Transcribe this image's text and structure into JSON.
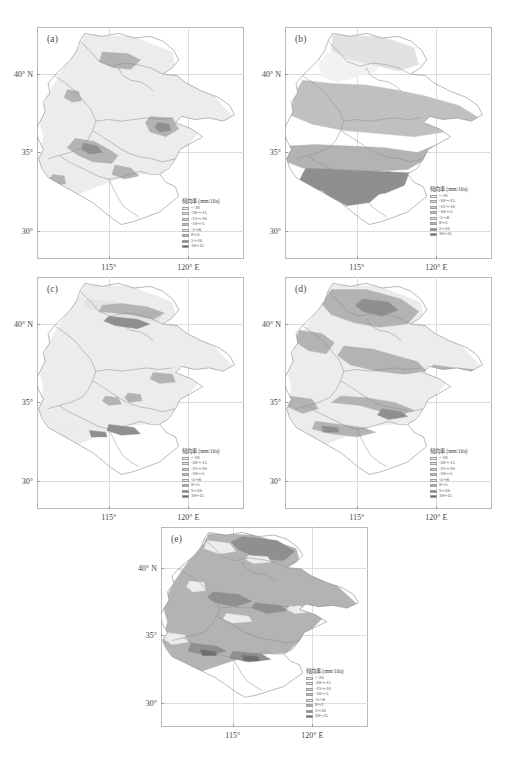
{
  "figure": {
    "type": "map-series",
    "panel_count": 5
  },
  "axes": {
    "x_ticks": [
      "115°",
      "120° E"
    ],
    "y_ticks": [
      "40° N",
      "35°",
      "30°"
    ],
    "x_values": [
      115,
      120
    ],
    "y_values": [
      40,
      35,
      30
    ],
    "xlim": [
      110.5,
      123.5
    ],
    "ylim": [
      28.2,
      43.0
    ]
  },
  "legend": {
    "title": "倾向率 (mm/10a)",
    "classes": [
      {
        "label": "<-20",
        "color": "#f2f2f2"
      },
      {
        "label": "-20～-15",
        "color": "#e2e2e2"
      },
      {
        "label": "-15～-10",
        "color": "#d2d2d2"
      },
      {
        "label": "-10～-5",
        "color": "#c0c0c0"
      },
      {
        "label": "-5～0",
        "color": "#ececec"
      },
      {
        "label": "0～5",
        "color": "#b3b3b3"
      },
      {
        "label": "5～10",
        "color": "#8f8f8f"
      },
      {
        "label": "10～15",
        "color": "#6e6e6e"
      }
    ]
  },
  "panels": [
    {
      "id": "a",
      "label": "(a)",
      "position": {
        "left": 37,
        "top": 27,
        "width": 207,
        "height": 232
      },
      "legend_position": {
        "left": 145,
        "top": 170
      }
    },
    {
      "id": "b",
      "label": "(b)",
      "position": {
        "left": 285,
        "top": 27,
        "width": 207,
        "height": 232
      },
      "legend_position": {
        "left": 145,
        "top": 158
      }
    },
    {
      "id": "c",
      "label": "(c)",
      "position": {
        "left": 37,
        "top": 277,
        "width": 207,
        "height": 232
      },
      "legend_position": {
        "left": 145,
        "top": 170
      }
    },
    {
      "id": "d",
      "label": "(d)",
      "position": {
        "left": 285,
        "top": 277,
        "width": 207,
        "height": 232
      },
      "legend_position": {
        "left": 145,
        "top": 170
      }
    },
    {
      "id": "e",
      "label": "(e)",
      "position": {
        "left": 161,
        "top": 527,
        "width": 207,
        "height": 200
      },
      "legend_position": {
        "left": 145,
        "top": 140
      }
    }
  ],
  "chart_data": {
    "type": "heatmap",
    "title": "",
    "xlabel": "",
    "ylabel": "",
    "variable": "倾向率 (mm/10a)",
    "units": "mm/10a",
    "grid": true,
    "legend_position": "inside-bottom-right",
    "class_breaks": [
      -20,
      -15,
      -10,
      -5,
      0,
      5,
      10,
      15
    ],
    "panel_summaries": [
      {
        "panel": "a",
        "dominant_class": "-5～0",
        "note": "mostly near-zero light shading with scattered 0～5 patches in central and eastern areas"
      },
      {
        "panel": "b",
        "dominant_class": "0～5",
        "note": "strong north-south gradient; darker positive band across southern half"
      },
      {
        "panel": "c",
        "dominant_class": "-5～0",
        "note": "light overall with narrow darker streaks in the north and south-central areas"
      },
      {
        "panel": "d",
        "dominant_class": "0～5",
        "note": "broad mid-gray coverage in northern and western regions"
      },
      {
        "panel": "e",
        "dominant_class": "0～5",
        "note": "most varied distribution with dark 5～10 cores in north and south"
      }
    ]
  }
}
